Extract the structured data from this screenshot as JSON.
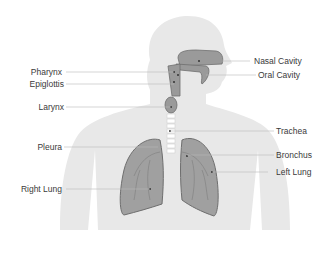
{
  "diagram": {
    "colors": {
      "silhouette": "#e6e6e6",
      "organ_fill": "#9a9a9a",
      "organ_stroke": "#6e6e6e",
      "leader_line": "#b5b5b5",
      "label_text": "#3a3a3a"
    },
    "labels": {
      "nasal_cavity": "Nasal Cavity",
      "oral_cavity": "Oral Cavity",
      "pharynx": "Pharynx",
      "epiglottis": "Epiglottis",
      "larynx": "Larynx",
      "trachea": "Trachea",
      "pleura": "Pleura",
      "bronchus": "Bronchus",
      "right_lung": "Right Lung",
      "left_lung": "Left Lung"
    }
  }
}
